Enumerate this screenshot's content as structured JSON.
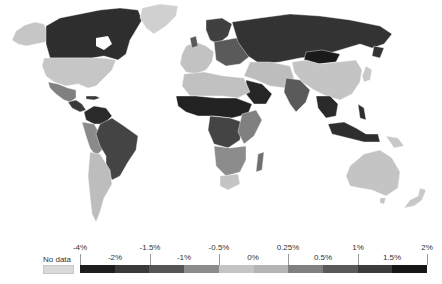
{
  "legend": {
    "no_data_label": "No data",
    "no_data_color": "#d9d9d9",
    "top_labels": [
      {
        "text": "-4%",
        "x": 80
      },
      {
        "text": "-1.5%",
        "x": 150
      },
      {
        "text": "-0.5%",
        "x": 219
      },
      {
        "text": "0.25%",
        "x": 288
      },
      {
        "text": "1%",
        "x": 358
      },
      {
        "text": "2%",
        "x": 427
      }
    ],
    "bottom_labels": [
      {
        "text": "-2%",
        "x": 115
      },
      {
        "text": "-1%",
        "x": 184
      },
      {
        "text": "0%",
        "x": 253
      },
      {
        "text": "0.5%",
        "x": 323
      },
      {
        "text": "1.5%",
        "x": 392
      }
    ],
    "segments": [
      {
        "range": "-4% to -2%",
        "color": "#1e1e1e"
      },
      {
        "range": "-2% to -1.5%",
        "color": "#3a3a3a"
      },
      {
        "range": "-1.5% to -1%",
        "color": "#555555"
      },
      {
        "range": "-1% to -0.5%",
        "color": "#8c8c8c"
      },
      {
        "range": "-0.5% to 0%",
        "color": "#c4c4c4"
      },
      {
        "range": "0% to 0.25%",
        "color": "#b4b4b4"
      },
      {
        "range": "0.25% to 0.5%",
        "color": "#808080"
      },
      {
        "range": "0.5% to 1%",
        "color": "#5a5a5a"
      },
      {
        "range": "1% to 1.5%",
        "color": "#3c3c3c"
      },
      {
        "range": "1.5% to 2%",
        "color": "#161616"
      }
    ]
  },
  "regions": {
    "canada": "#2e2e2e",
    "alaska_usa": "#c6c6c6",
    "greenland": "#d0d0d0",
    "mexico": "#808080",
    "central_america": "#3a3a3a",
    "venezuela_colombia": "#2a2a2a",
    "brazil": "#444444",
    "andes": "#8a8a8a",
    "argentina_chile": "#bdbdbd",
    "europe_west": "#c2c2c2",
    "europe_east": "#5a5a5a",
    "scandinavia": "#404040",
    "russia": "#333333",
    "mongolia": "#1a1a1a",
    "china": "#c4c4c4",
    "india": "#5a5a5a",
    "middle_east": "#bdbdbd",
    "arabia": "#262626",
    "north_africa": "#c0c0c0",
    "sahel": "#222222",
    "central_africa": "#444444",
    "east_africa": "#808080",
    "southern_africa": "#8c8c8c",
    "south_africa": "#c4c4c4",
    "madagascar": "#707070",
    "southeast_asia": "#2a2a2a",
    "indonesia": "#2e2e2e",
    "japan": "#c8c8c8",
    "australia": "#c4c4c4",
    "new_zealand": "#c8c8c8",
    "papua": "#c8c8c8"
  }
}
